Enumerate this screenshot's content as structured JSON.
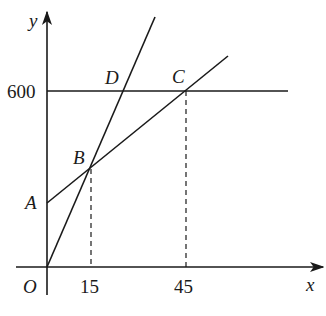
{
  "diagram": {
    "type": "coordinate-graph",
    "axes": {
      "x_label": "x",
      "y_label": "y",
      "origin_label": "O"
    },
    "ticks": {
      "x": [
        "15",
        "45"
      ],
      "y": [
        "600"
      ]
    },
    "points": {
      "A": "A",
      "B": "B",
      "C": "C",
      "D": "D"
    },
    "lines": [
      {
        "name": "line-OD",
        "description": "steep line through O, B and D"
      },
      {
        "name": "line-AC",
        "description": "line through A, B and C"
      },
      {
        "name": "line-y600",
        "description": "horizontal line y = 600 through D and C"
      }
    ],
    "guides": [
      {
        "name": "dashed-B-to-15",
        "description": "vertical dashed line from B down to x = 15"
      },
      {
        "name": "dashed-C-to-45",
        "description": "vertical dashed line from C down to x = 45"
      }
    ],
    "colors": {
      "ink": "#1a1a1a",
      "background": "#ffffff"
    }
  }
}
